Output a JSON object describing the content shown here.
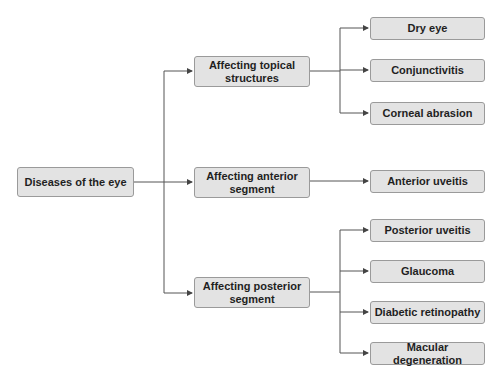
{
  "diagram": {
    "root": {
      "label": "Diseases of the eye"
    },
    "categories": [
      {
        "label": "Affecting topical structures",
        "children": [
          "Dry eye",
          "Conjunctivitis",
          "Corneal abrasion"
        ]
      },
      {
        "label": "Affecting anterior segment",
        "children": [
          "Anterior uveitis"
        ]
      },
      {
        "label": "Affecting posterior segment",
        "children": [
          "Posterior uveitis",
          "Glaucoma",
          "Diabetic retinopathy",
          "Macular degeneration"
        ]
      }
    ],
    "colors": {
      "box_fill": "#e3e3e3",
      "box_border": "#9a9a9a",
      "line": "#555555",
      "text": "#1f1f1f"
    }
  }
}
